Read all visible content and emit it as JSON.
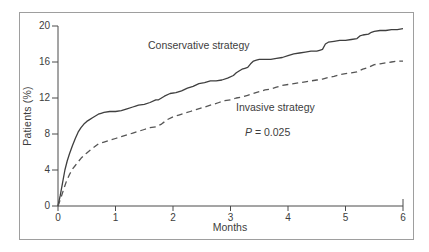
{
  "colors": {
    "conservative_line": "#3f3f3f",
    "invasive_line": "#555555",
    "axis": "#4a4a4a",
    "frame_border": "#9e9e9e",
    "text": "#3d3d3d"
  },
  "chart_data": {
    "type": "line",
    "title": "",
    "xlabel": "Months",
    "ylabel": "Patients (%)",
    "xlim": [
      0,
      6
    ],
    "ylim": [
      0,
      20
    ],
    "x_ticks": [
      0,
      1,
      2,
      3,
      4,
      5,
      6
    ],
    "y_ticks": [
      0,
      4,
      8,
      12,
      16,
      20
    ],
    "grid": false,
    "legend_position": "inline-labels",
    "annotation": {
      "symbol": "P",
      "rest": " = 0.025"
    },
    "series": [
      {
        "name": "Conservative strategy",
        "style": "solid",
        "color": "#3f3f3f",
        "x": [
          0,
          0.04,
          0.08,
          0.12,
          0.16,
          0.2,
          0.25,
          0.3,
          0.35,
          0.4,
          0.45,
          0.5,
          0.55,
          0.6,
          0.65,
          0.7,
          0.75,
          0.8,
          0.9,
          1.0,
          1.1,
          1.2,
          1.3,
          1.35,
          1.4,
          1.5,
          1.6,
          1.7,
          1.75,
          1.85,
          1.95,
          2.05,
          2.15,
          2.25,
          2.35,
          2.45,
          2.55,
          2.65,
          2.75,
          2.85,
          2.95,
          3.05,
          3.1,
          3.15,
          3.2,
          3.25,
          3.3,
          3.35,
          3.4,
          3.45,
          3.5,
          3.6,
          3.7,
          3.8,
          3.9,
          4.0,
          4.1,
          4.2,
          4.3,
          4.4,
          4.5,
          4.55,
          4.6,
          4.65,
          4.7,
          4.8,
          4.9,
          5.0,
          5.1,
          5.2,
          5.25,
          5.3,
          5.4,
          5.45,
          5.5,
          5.6,
          5.7,
          5.8,
          5.9,
          6.0
        ],
        "y": [
          0,
          1.2,
          2.6,
          4.0,
          5.0,
          5.8,
          6.7,
          7.5,
          8.2,
          8.7,
          9.1,
          9.4,
          9.6,
          9.8,
          10.0,
          10.2,
          10.3,
          10.4,
          10.5,
          10.5,
          10.6,
          10.8,
          11.0,
          11.1,
          11.2,
          11.3,
          11.5,
          11.8,
          11.8,
          12.2,
          12.5,
          12.6,
          12.8,
          13.1,
          13.3,
          13.6,
          13.7,
          13.9,
          13.9,
          14.0,
          14.2,
          14.5,
          14.8,
          15.0,
          15.2,
          15.3,
          15.4,
          15.8,
          16.1,
          16.2,
          16.3,
          16.3,
          16.3,
          16.4,
          16.5,
          16.7,
          16.9,
          17.0,
          17.1,
          17.2,
          17.2,
          17.3,
          17.4,
          18.0,
          18.2,
          18.3,
          18.4,
          18.4,
          18.5,
          18.6,
          18.9,
          19.0,
          19.1,
          19.3,
          19.4,
          19.5,
          19.5,
          19.6,
          19.6,
          19.7
        ]
      },
      {
        "name": "Invasive strategy",
        "style": "dashed",
        "color": "#555555",
        "x": [
          0,
          0.05,
          0.1,
          0.15,
          0.2,
          0.25,
          0.3,
          0.35,
          0.4,
          0.45,
          0.5,
          0.6,
          0.7,
          0.8,
          0.9,
          1.0,
          1.1,
          1.2,
          1.3,
          1.4,
          1.5,
          1.6,
          1.7,
          1.8,
          1.9,
          2.0,
          2.1,
          2.2,
          2.3,
          2.4,
          2.5,
          2.6,
          2.7,
          2.8,
          2.9,
          3.0,
          3.1,
          3.2,
          3.3,
          3.4,
          3.5,
          3.6,
          3.7,
          3.8,
          3.9,
          4.0,
          4.1,
          4.2,
          4.3,
          4.4,
          4.5,
          4.6,
          4.7,
          4.8,
          4.9,
          5.0,
          5.1,
          5.2,
          5.3,
          5.4,
          5.5,
          5.6,
          5.7,
          5.8,
          5.9,
          6.0
        ],
        "y": [
          0,
          0.9,
          1.9,
          2.8,
          3.5,
          4.1,
          4.5,
          4.9,
          5.3,
          5.6,
          5.9,
          6.4,
          6.9,
          7.1,
          7.3,
          7.5,
          7.7,
          7.9,
          8.1,
          8.3,
          8.5,
          8.7,
          8.8,
          9.1,
          9.6,
          9.9,
          10.1,
          10.3,
          10.5,
          10.7,
          10.9,
          11.1,
          11.3,
          11.5,
          11.7,
          11.8,
          12.0,
          12.1,
          12.3,
          12.5,
          12.7,
          12.9,
          13.0,
          13.2,
          13.4,
          13.5,
          13.6,
          13.7,
          13.8,
          13.9,
          14.0,
          14.1,
          14.3,
          14.4,
          14.6,
          14.7,
          14.8,
          14.9,
          15.2,
          15.4,
          15.7,
          15.8,
          15.9,
          16.0,
          16.1,
          16.1
        ]
      }
    ]
  }
}
